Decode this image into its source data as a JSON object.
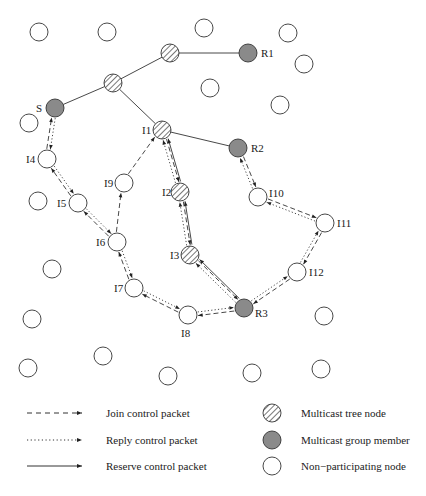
{
  "diagram": {
    "nodes": [
      {
        "id": "S",
        "type": "member",
        "x": 55,
        "y": 108,
        "label": "S",
        "lx": 36,
        "ly": 112
      },
      {
        "id": "R1",
        "type": "member",
        "x": 248,
        "y": 53,
        "label": "R1",
        "lx": 261,
        "ly": 57
      },
      {
        "id": "R2",
        "type": "member",
        "x": 238,
        "y": 148,
        "label": "R2",
        "lx": 251,
        "ly": 152
      },
      {
        "id": "R3",
        "type": "member",
        "x": 244,
        "y": 308,
        "label": "R3",
        "lx": 255,
        "ly": 317
      },
      {
        "id": "T1",
        "type": "tree",
        "x": 170,
        "y": 53,
        "label": ""
      },
      {
        "id": "T2",
        "type": "tree",
        "x": 113,
        "y": 83,
        "label": ""
      },
      {
        "id": "I1",
        "type": "tree",
        "x": 162,
        "y": 130,
        "label": "I1",
        "lx": 142,
        "ly": 134
      },
      {
        "id": "I2",
        "type": "tree",
        "x": 180,
        "y": 192,
        "label": "I2",
        "lx": 162,
        "ly": 196
      },
      {
        "id": "I3",
        "type": "tree",
        "x": 190,
        "y": 255,
        "label": "I3",
        "lx": 170,
        "ly": 259
      },
      {
        "id": "I4",
        "type": "plain",
        "x": 47,
        "y": 159,
        "label": "I4",
        "lx": 26,
        "ly": 163
      },
      {
        "id": "I5",
        "type": "plain",
        "x": 78,
        "y": 203,
        "label": "I5",
        "lx": 57,
        "ly": 207
      },
      {
        "id": "I6",
        "type": "plain",
        "x": 117,
        "y": 242,
        "label": "I6",
        "lx": 96,
        "ly": 246
      },
      {
        "id": "I7",
        "type": "plain",
        "x": 134,
        "y": 288,
        "label": "I7",
        "lx": 114,
        "ly": 292
      },
      {
        "id": "I8",
        "type": "plain",
        "x": 188,
        "y": 315,
        "label": "I8",
        "lx": 181,
        "ly": 337
      },
      {
        "id": "I9",
        "type": "plain",
        "x": 124,
        "y": 183,
        "label": "I9",
        "lx": 104,
        "ly": 187
      },
      {
        "id": "I10",
        "type": "plain",
        "x": 258,
        "y": 197,
        "label": "I10",
        "lx": 269,
        "ly": 197
      },
      {
        "id": "I11",
        "type": "plain",
        "x": 325,
        "y": 223,
        "label": "I11",
        "lx": 337,
        "ly": 227
      },
      {
        "id": "I12",
        "type": "plain",
        "x": 297,
        "y": 272,
        "label": "I12",
        "lx": 309,
        "ly": 276
      },
      {
        "id": "p1",
        "type": "plain",
        "x": 39,
        "y": 32,
        "label": ""
      },
      {
        "id": "p2",
        "type": "plain",
        "x": 107,
        "y": 32,
        "label": ""
      },
      {
        "id": "p3",
        "type": "plain",
        "x": 204,
        "y": 28,
        "label": ""
      },
      {
        "id": "p4",
        "type": "plain",
        "x": 288,
        "y": 33,
        "label": ""
      },
      {
        "id": "p5",
        "type": "plain",
        "x": 304,
        "y": 64,
        "label": ""
      },
      {
        "id": "p6",
        "type": "plain",
        "x": 210,
        "y": 88,
        "label": ""
      },
      {
        "id": "p7",
        "type": "plain",
        "x": 280,
        "y": 105,
        "label": ""
      },
      {
        "id": "p8",
        "type": "plain",
        "x": 29,
        "y": 123,
        "label": ""
      },
      {
        "id": "p9",
        "type": "plain",
        "x": 38,
        "y": 201,
        "label": ""
      },
      {
        "id": "p10",
        "type": "plain",
        "x": 52,
        "y": 269,
        "label": ""
      },
      {
        "id": "p11",
        "type": "plain",
        "x": 32,
        "y": 319,
        "label": ""
      },
      {
        "id": "p12",
        "type": "plain",
        "x": 103,
        "y": 356,
        "label": ""
      },
      {
        "id": "p13",
        "type": "plain",
        "x": 28,
        "y": 368,
        "label": ""
      },
      {
        "id": "p14",
        "type": "plain",
        "x": 168,
        "y": 376,
        "label": ""
      },
      {
        "id": "p15",
        "type": "plain",
        "x": 252,
        "y": 373,
        "label": ""
      },
      {
        "id": "p16",
        "type": "plain",
        "x": 321,
        "y": 369,
        "label": ""
      },
      {
        "id": "p17",
        "type": "plain",
        "x": 324,
        "y": 316,
        "label": ""
      }
    ],
    "tree_edges": [
      [
        "T1",
        "R1"
      ],
      [
        "T1",
        "T2"
      ],
      [
        "T2",
        "S"
      ],
      [
        "T2",
        "I1"
      ],
      [
        "I1",
        "R2"
      ]
    ],
    "join_edges": [
      [
        "I4",
        "S"
      ],
      [
        "I5",
        "I4"
      ],
      [
        "I6",
        "I5"
      ],
      [
        "I6",
        "I9"
      ],
      [
        "I9",
        "I1"
      ],
      [
        "I7",
        "I6"
      ],
      [
        "I8",
        "I7"
      ],
      [
        "R3",
        "I8"
      ],
      [
        "I1",
        "I2"
      ],
      [
        "I2",
        "I3"
      ],
      [
        "I3",
        "R3"
      ],
      [
        "R2",
        "I10"
      ],
      [
        "I10",
        "I11"
      ],
      [
        "I11",
        "I12"
      ],
      [
        "I12",
        "R3"
      ]
    ],
    "reply_edges": [
      [
        "S",
        "I4"
      ],
      [
        "I4",
        "I5"
      ],
      [
        "I5",
        "I6"
      ],
      [
        "I6",
        "I7"
      ],
      [
        "I7",
        "I8"
      ],
      [
        "I8",
        "R3"
      ],
      [
        "I2",
        "I1"
      ],
      [
        "I3",
        "I2"
      ],
      [
        "R3",
        "I3"
      ],
      [
        "I10",
        "R2"
      ],
      [
        "I11",
        "I10"
      ],
      [
        "I12",
        "I11"
      ],
      [
        "R3",
        "I12"
      ]
    ],
    "reserve_edges": [
      [
        "R3",
        "I3"
      ],
      [
        "I3",
        "I2"
      ],
      [
        "I2",
        "I1"
      ]
    ]
  },
  "legend": {
    "lines": [
      {
        "style": "dashed",
        "label": "Join control packet"
      },
      {
        "style": "dotted",
        "label": "Reply control packet"
      },
      {
        "style": "solid",
        "label": "Reserve control packet"
      }
    ],
    "nodes": [
      {
        "type": "tree",
        "label": "Multicast tree node"
      },
      {
        "type": "member",
        "label": "Multicast group member"
      },
      {
        "type": "plain",
        "label": "Non−participating node"
      }
    ]
  },
  "colors": {
    "member_fill": "#8a8a8a",
    "stroke": "#333333",
    "line": "#333333"
  }
}
